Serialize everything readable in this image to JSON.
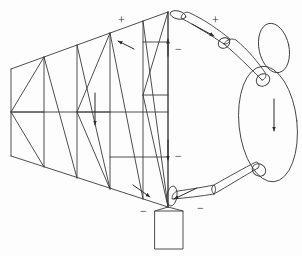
{
  "figure": {
    "type": "line-diagram",
    "background_color": "#fdfdfd",
    "stroke_color": "#3a3a3a",
    "canvas": {
      "width": 302,
      "height": 256
    }
  },
  "labels": {
    "plus_top_left": "+",
    "plus_top_right": "+",
    "minus_upper_mast": "−",
    "minus_lower_mast": "−",
    "minus_base_left": "−",
    "minus_base_right": "−"
  },
  "label_positions": {
    "plus_top_left": {
      "x": 118,
      "y": 14
    },
    "plus_top_right": {
      "x": 212,
      "y": 14
    },
    "minus_upper_mast": {
      "x": 175,
      "y": 43
    },
    "minus_lower_mast": {
      "x": 175,
      "y": 150
    },
    "minus_base_left": {
      "x": 140,
      "y": 205
    },
    "minus_base_right": {
      "x": 197,
      "y": 202
    }
  },
  "arrows": [
    {
      "name": "top-chord-force-arrow",
      "label": "compression along top chord",
      "x1": 132,
      "y1": 48,
      "x2": 118,
      "y2": 41
    },
    {
      "name": "truss-mid-load-arrow",
      "label": "vertical load at truss mid panel",
      "x1": 95,
      "y1": 95,
      "x2": 95,
      "y2": 126
    },
    {
      "name": "mast-up-arrow",
      "label": "upward reaction on mast",
      "x1": 169,
      "y1": 55,
      "x2": 169,
      "y2": 39
    },
    {
      "name": "mast-down-arrow",
      "label": "downward reaction on mast",
      "x1": 169,
      "y1": 140,
      "x2": 169,
      "y2": 160
    },
    {
      "name": "bottom-chord-force-arrow",
      "label": "tension along bottom chord",
      "x1": 134,
      "y1": 186,
      "x2": 150,
      "y2": 197
    },
    {
      "name": "upper-arm-force-arrow",
      "label": "force along upper arm",
      "x1": 192,
      "y1": 25,
      "x2": 213,
      "y2": 36
    },
    {
      "name": "lower-arm-force-arrow",
      "label": "force along lower arm",
      "x1": 196,
      "y1": 188,
      "x2": 172,
      "y2": 200
    },
    {
      "name": "torso-weight-arrow",
      "label": "body weight downward",
      "x1": 274,
      "y1": 100,
      "x2": 274,
      "y2": 132
    }
  ],
  "truss": {
    "name": "crane-boom-truss",
    "top_chord": [
      [
        11,
        69
      ],
      [
        168,
        12
      ]
    ],
    "bottom_chord": [
      [
        11,
        156
      ],
      [
        168,
        207
      ]
    ],
    "panel_verticals_x": [
      11,
      44,
      77,
      110,
      143,
      168
    ],
    "mid_chord_label": "mid chord"
  },
  "base": {
    "name": "crane-base",
    "label": "support base",
    "x": 155,
    "y": 211,
    "width": 28,
    "height": 38
  },
  "figure_body": {
    "head": {
      "name": "head-ellipse",
      "cx": 274,
      "cy": 48,
      "rx": 16,
      "ry": 25,
      "rotate": -12
    },
    "torso": {
      "name": "torso-ellipse",
      "cx": 268,
      "cy": 122,
      "rx": 30,
      "ry": 59,
      "rotate": -6
    },
    "upper_arm": {
      "name": "upper-arm-segment",
      "label": "upper arm"
    },
    "forearm": {
      "name": "forearm-segment",
      "label": "forearm"
    },
    "lower_arm_upper": {
      "name": "lower-arm-upper-segment",
      "label": "lower arm upper"
    },
    "lower_arm_lower": {
      "name": "lower-arm-lower-segment",
      "label": "lower arm lower"
    },
    "shoulder_joint": {
      "name": "shoulder-joint",
      "cx": 263,
      "cy": 82
    },
    "elbow_joint": {
      "name": "elbow-joint",
      "cx": 224,
      "cy": 43
    },
    "hand_joint": {
      "name": "hand-joint",
      "cx": 178,
      "cy": 15
    },
    "hip_joint": {
      "name": "hip-joint",
      "cx": 259,
      "cy": 172
    },
    "grip_joint": {
      "name": "grip-joint",
      "cx": 172,
      "cy": 199
    }
  }
}
